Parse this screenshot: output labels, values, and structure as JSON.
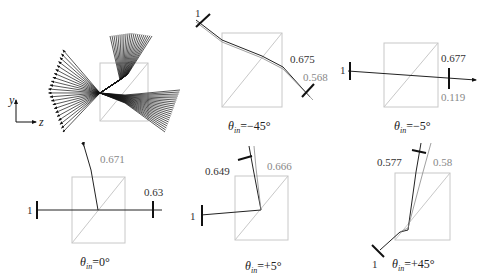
{
  "overview": {
    "axes": {
      "y_label": "y",
      "z_label": "z"
    }
  },
  "panels": [
    {
      "id": "theta-minus-45",
      "caption_theta": "θ",
      "caption_sub": "in",
      "caption_value": "=−45°",
      "labels": {
        "input": "1",
        "output_a": "0.675",
        "output_b": "0.568"
      }
    },
    {
      "id": "theta-minus-5",
      "caption_theta": "θ",
      "caption_sub": "in",
      "caption_value": "=−5°",
      "labels": {
        "input": "1",
        "output_a": "0.677",
        "output_b": "0.119"
      }
    },
    {
      "id": "theta-0",
      "caption_theta": "θ",
      "caption_sub": "in",
      "caption_value": "=0°",
      "labels": {
        "input": "1",
        "output_a": "0.63",
        "output_b": "0.671"
      }
    },
    {
      "id": "theta-plus-5",
      "caption_theta": "θ",
      "caption_sub": "in",
      "caption_value": "=+5°",
      "labels": {
        "input": "1",
        "output_a": "0.649",
        "output_b": "0.666"
      }
    },
    {
      "id": "theta-plus-45",
      "caption_theta": "θ",
      "caption_sub": "in",
      "caption_value": "=+45°",
      "labels": {
        "input": "1",
        "output_a": "0.577",
        "output_b": "0.58"
      }
    }
  ],
  "colors": {
    "ray": "#222222",
    "ray_secondary": "#888888",
    "prism": "#c8c8c8",
    "label_gray": "#888888"
  }
}
